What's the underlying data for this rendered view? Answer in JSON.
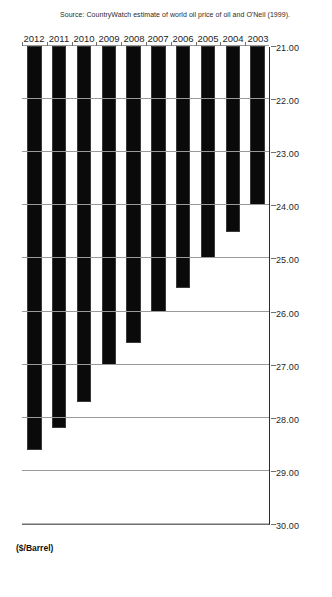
{
  "chart_data": {
    "type": "bar",
    "orientation": "horizontal",
    "title": "",
    "xlabel": "($/Barrel)",
    "ylabel": "Year",
    "categories": [
      "2012",
      "2011",
      "2010",
      "2009",
      "2008",
      "2007",
      "2006",
      "2005",
      "2004",
      "2003"
    ],
    "values": [
      28.6,
      28.2,
      27.7,
      27.0,
      26.6,
      26.0,
      25.55,
      25.0,
      24.5,
      24.0
    ],
    "value_axis_ticks": [
      "30.00",
      "29.00",
      "28.00",
      "27.00",
      "26.00",
      "25.00",
      "24.00",
      "23.00",
      "22.00",
      "21.00"
    ],
    "value_axis_tick_values": [
      30,
      29,
      28,
      27,
      26,
      25,
      24,
      23,
      22,
      21
    ],
    "xlim": [
      30.0,
      21.0
    ],
    "axis_reversed": true,
    "grid": true,
    "legend": false,
    "bar_color": "#0a0a0a",
    "gridline_color": "#9a9a9a",
    "axis_color": "#6f6f6f",
    "source_note": "Source: CountryWatch estimate of world oil price of oil and O'Neil (1999)."
  }
}
